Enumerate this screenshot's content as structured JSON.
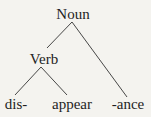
{
  "diagram": {
    "type": "morphological-tree",
    "root": {
      "label": "Noun",
      "children": [
        {
          "label": "Verb",
          "children": [
            {
              "label": "dis-"
            },
            {
              "label": "appear"
            }
          ]
        },
        {
          "label": "-ance"
        }
      ]
    },
    "nodes": {
      "noun": "Noun",
      "verb": "Verb",
      "dis": "dis-",
      "appear": "appear",
      "ance": "-ance"
    },
    "colors": {
      "background": "#f4f3ef",
      "text": "#1e1e1e",
      "edges": "#333333"
    }
  }
}
